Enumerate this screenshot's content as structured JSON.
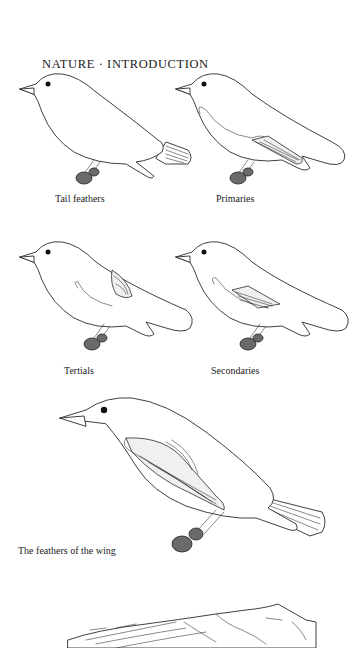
{
  "page": {
    "header": "NATURE · INTRODUCTION",
    "figures": [
      {
        "id": "tail-feathers",
        "caption": "Tail feathers",
        "highlight": "tail"
      },
      {
        "id": "primaries",
        "caption": "Primaries",
        "highlight": "primaries"
      },
      {
        "id": "tertials",
        "caption": "Tertials",
        "highlight": "tertials"
      },
      {
        "id": "secondaries",
        "caption": "Secondaries",
        "highlight": "secondaries"
      },
      {
        "id": "wing-feathers",
        "caption": "The feathers of the wing",
        "highlight": "all"
      }
    ],
    "bottom_figure": {
      "id": "spread-wing",
      "subject": "outstretched wing (partially visible)"
    }
  }
}
